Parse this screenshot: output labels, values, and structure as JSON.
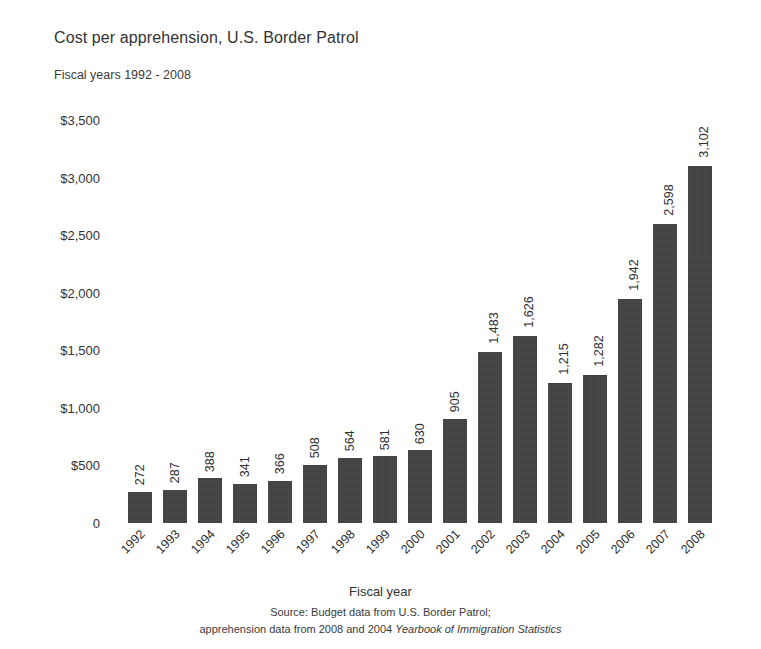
{
  "chart_data": {
    "type": "bar",
    "title": "Cost per apprehension, U.S. Border Patrol",
    "subtitle": "Fiscal years 1992 - 2008",
    "xlabel": "Fiscal year",
    "ylabel": "",
    "ylim": [
      0,
      3500
    ],
    "ytick_values": [
      3500,
      3000,
      2500,
      2000,
      1500,
      1000,
      500,
      0
    ],
    "ytick_labels": [
      "$3,500",
      "$3,000",
      "$2,500",
      "$2,000",
      "$1,500",
      "$1,000",
      "$500",
      "0"
    ],
    "grid": false,
    "legend": null,
    "categories": [
      "1992",
      "1993",
      "1994",
      "1995",
      "1996",
      "1997",
      "1998",
      "1999",
      "2000",
      "2001",
      "2002",
      "2003",
      "2004",
      "2005",
      "2006",
      "2007",
      "2008"
    ],
    "values": [
      272,
      287,
      388,
      341,
      366,
      508,
      564,
      581,
      630,
      905,
      1483,
      1626,
      1215,
      1282,
      1942,
      2598,
      3102
    ],
    "value_labels": [
      "272",
      "287",
      "388",
      "341",
      "366",
      "508",
      "564",
      "581",
      "630",
      "905",
      "1,483",
      "1,626",
      "1,215",
      "1,282",
      "1,942",
      "2,598",
      "3,102"
    ],
    "bar_color": "#3b3b3b",
    "background_color": "#ffffff",
    "value_label_rotation": -90,
    "category_label_rotation": -45
  },
  "source": {
    "line1": "Source: Budget data from U.S. Border Patrol;",
    "line2_prefix": "apprehension data from 2008 and 2004 ",
    "line2_italic": "Yearbook of Immigration Statistics"
  }
}
